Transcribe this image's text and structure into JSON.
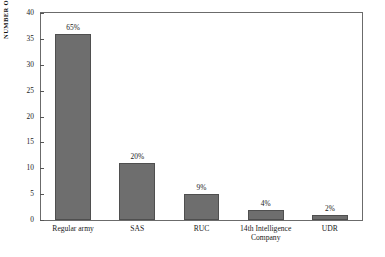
{
  "chart_data": {
    "type": "bar",
    "title": "",
    "xlabel": "",
    "ylabel": "NUMBER OF DEATHS",
    "ylim": [
      0,
      40
    ],
    "grid": false,
    "legend": "none",
    "categories": [
      "Regular army",
      "SAS",
      "RUC",
      "14th Intelligence Company",
      "UDR"
    ],
    "category_lines": [
      [
        "Regular army"
      ],
      [
        "SAS"
      ],
      [
        "RUC"
      ],
      [
        "14th Intelligence",
        "Company"
      ],
      [
        "UDR"
      ]
    ],
    "values": [
      36,
      11,
      5,
      2,
      1
    ],
    "data_labels": [
      "65%",
      "20%",
      "9%",
      "4%",
      "2%"
    ],
    "yticks": [
      0,
      5,
      10,
      15,
      20,
      25,
      30,
      35,
      40
    ],
    "ytick_labels": [
      "0",
      "5",
      "10",
      "15",
      "20",
      "25",
      "30",
      "35",
      "40"
    ],
    "bar_color": "#6e6e6e",
    "frame_color": "#6b6b6b",
    "background": "#ffffff"
  }
}
